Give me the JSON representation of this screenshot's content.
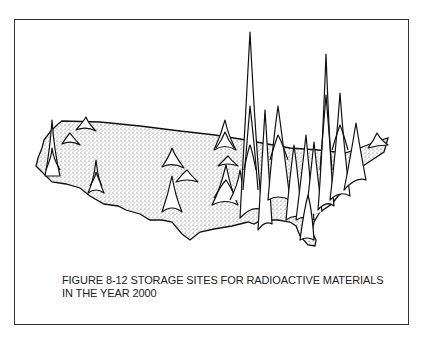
{
  "figure": {
    "caption_line1": "FIGURE 8-12  STORAGE SITES FOR RADIOACTIVE MATERIALS",
    "caption_line2": "IN THE YEAR 2000",
    "colors": {
      "frame": "#333333",
      "ink": "#111111",
      "stipple": "#555555",
      "background": "#ffffff"
    }
  }
}
